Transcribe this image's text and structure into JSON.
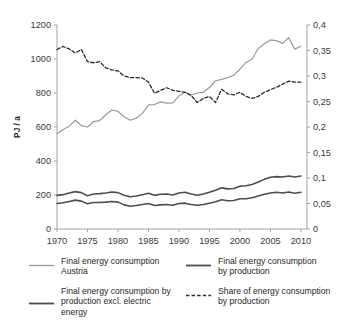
{
  "chart_data": {
    "type": "line",
    "title": "",
    "xlabel": "",
    "ylabel": "PJ / a",
    "ylabel_right": "",
    "grid": false,
    "legend_position": "bottom",
    "xlim": [
      1970,
      2011
    ],
    "ylim": [
      0,
      1200
    ],
    "ylim_right": [
      0,
      0.4
    ],
    "x_tick_labels": [
      "1970",
      "1975",
      "1980",
      "1985",
      "1990",
      "1995",
      "2000",
      "2005",
      "2010"
    ],
    "x_ticks": [
      1970,
      1975,
      1980,
      1985,
      1990,
      1995,
      2000,
      2005,
      2010
    ],
    "y_tick_labels": [
      "0",
      "200",
      "400",
      "600",
      "800",
      "1000",
      "1200"
    ],
    "y_ticks": [
      0,
      200,
      400,
      600,
      800,
      1000,
      1200
    ],
    "y_right_tick_labels": [
      "0",
      "0,05",
      "0,1",
      "0,15",
      "0,2",
      "0,25",
      "0,3",
      "0,35",
      "0,4"
    ],
    "y_right_ticks": [
      0,
      0.05,
      0.1,
      0.15,
      0.2,
      0.25,
      0.3,
      0.35,
      0.4
    ],
    "x": [
      1970,
      1971,
      1972,
      1973,
      1974,
      1975,
      1976,
      1977,
      1978,
      1979,
      1980,
      1981,
      1982,
      1983,
      1984,
      1985,
      1986,
      1987,
      1988,
      1989,
      1990,
      1991,
      1992,
      1993,
      1994,
      1995,
      1996,
      1997,
      1998,
      1999,
      2000,
      2001,
      2002,
      2003,
      2004,
      2005,
      2006,
      2007,
      2008,
      2009,
      2010
    ],
    "series": [
      {
        "name": "Final energy consumption Austria",
        "axis": "left",
        "style": "solid",
        "color": "#9a9a9a",
        "width": 1.2,
        "values": [
          560,
          585,
          605,
          640,
          608,
          600,
          632,
          638,
          672,
          700,
          692,
          660,
          640,
          652,
          680,
          730,
          732,
          748,
          740,
          742,
          782,
          805,
          788,
          800,
          804,
          832,
          872,
          880,
          890,
          905,
          940,
          980,
          1000,
          1062,
          1090,
          1112,
          1108,
          1092,
          1125,
          1058,
          1075
        ]
      },
      {
        "name": "Final energy consumption by production",
        "axis": "left",
        "style": "solid",
        "color": "#4d4d4d",
        "width": 1.6,
        "values": [
          198,
          202,
          212,
          220,
          214,
          196,
          206,
          208,
          212,
          218,
          214,
          198,
          190,
          194,
          202,
          210,
          198,
          204,
          206,
          200,
          212,
          216,
          206,
          198,
          206,
          216,
          228,
          242,
          236,
          238,
          252,
          254,
          262,
          276,
          292,
          304,
          308,
          306,
          312,
          306,
          312
        ]
      },
      {
        "name": "Final energy consumption by production excl. electric energy",
        "axis": "left",
        "style": "solid",
        "color": "#4d4d4d",
        "width": 1.6,
        "values": [
          150,
          154,
          162,
          170,
          164,
          148,
          156,
          156,
          158,
          162,
          158,
          142,
          134,
          138,
          144,
          150,
          138,
          142,
          144,
          140,
          150,
          152,
          144,
          140,
          144,
          152,
          160,
          172,
          166,
          168,
          178,
          178,
          184,
          194,
          204,
          212,
          216,
          212,
          218,
          210,
          216
        ]
      },
      {
        "name": "Share of energy consumption by production",
        "axis": "right",
        "style": "dashed",
        "color": "#2b2b2b",
        "width": 1.3,
        "values": [
          0.352,
          0.358,
          0.353,
          0.345,
          0.352,
          0.328,
          0.326,
          0.328,
          0.316,
          0.312,
          0.31,
          0.3,
          0.297,
          0.297,
          0.296,
          0.288,
          0.266,
          0.272,
          0.277,
          0.272,
          0.27,
          0.268,
          0.262,
          0.248,
          0.256,
          0.26,
          0.248,
          0.274,
          0.265,
          0.263,
          0.268,
          0.26,
          0.256,
          0.26,
          0.268,
          0.273,
          0.278,
          0.284,
          0.29,
          0.288,
          0.288
        ]
      }
    ]
  },
  "legend": {
    "entries": [
      {
        "label": "Final energy consumption\nAustria",
        "style": "solid",
        "color": "#9a9a9a",
        "width": 1.3
      },
      {
        "label": "Final energy consumption\nby production",
        "style": "solid",
        "color": "#4d4d4d",
        "width": 1.8
      },
      {
        "label": "Final energy consumption by\nproduction excl. electric\nenergy",
        "style": "solid",
        "color": "#4d4d4d",
        "width": 1.8
      },
      {
        "label": "Share of energy consumption\nby production",
        "style": "dashed",
        "color": "#2b2b2b",
        "width": 1.4
      }
    ]
  }
}
